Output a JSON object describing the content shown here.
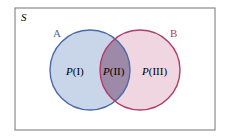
{
  "diagram": {
    "type": "venn",
    "universe_label": "S",
    "sets": [
      {
        "name": "A",
        "stroke": "#4a6aa8",
        "fill": "#c9d5e8"
      },
      {
        "name": "B",
        "stroke": "#b23c68",
        "fill": "#f0d6e0"
      }
    ],
    "intersection_fill": "#9c8aa8",
    "regions": [
      {
        "id": "I",
        "prob_symbol": "P",
        "region_label": "(I)"
      },
      {
        "id": "II",
        "prob_symbol": "P",
        "region_label": "(II)"
      },
      {
        "id": "III",
        "prob_symbol": "P",
        "region_label": "(III)"
      }
    ],
    "frame_color": "#8a8a8a"
  }
}
